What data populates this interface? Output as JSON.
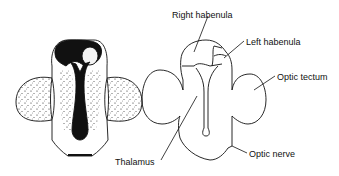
{
  "diagram": {
    "panels": [
      {
        "id": "left",
        "style": "stippled"
      },
      {
        "id": "right",
        "style": "outline"
      }
    ],
    "labels": [
      {
        "id": "right-habenula",
        "text": "Right habenula",
        "x": 172,
        "y": 10
      },
      {
        "id": "left-habenula",
        "text": "Left habenula",
        "x": 246,
        "y": 37
      },
      {
        "id": "optic-tectum",
        "text": "Optic tectum",
        "x": 277,
        "y": 72
      },
      {
        "id": "thalamus",
        "text": "Thalamus",
        "x": 76,
        "y": 157
      },
      {
        "id": "optic-nerve",
        "text": "Optic nerve",
        "x": 249,
        "y": 149
      }
    ],
    "colors": {
      "ink": "#111111",
      "background": "#ffffff"
    }
  }
}
